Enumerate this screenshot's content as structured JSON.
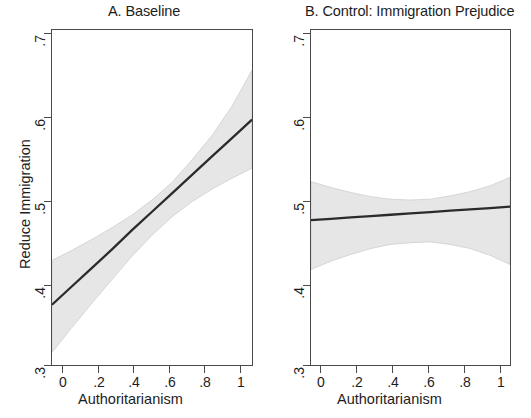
{
  "figure": {
    "background": "#ffffff",
    "line_color": "#2b2b2b",
    "band_color": "#e4e4e4",
    "axis_color": "#4a4a4a",
    "text_color": "#1d1d1d"
  },
  "panels": [
    {
      "id": "a",
      "title": "A. Baseline",
      "ylabel": "Reduce Immigration",
      "xlabel": "Authoritarianism",
      "ytick_labels": [
        ".7",
        ".6",
        ".5",
        ".4",
        ".3"
      ],
      "xtick_labels": [
        "0",
        ".2",
        ".4",
        ".6",
        ".8",
        "1"
      ]
    },
    {
      "id": "b",
      "title": "B. Control: Immigration Prejudice",
      "ylabel": "",
      "xlabel": "Authoritarianism",
      "ytick_labels": [
        ".7",
        ".6",
        ".5",
        ".4",
        ".3"
      ],
      "xtick_labels": [
        "0",
        ".2",
        ".4",
        ".6",
        ".8",
        "1"
      ]
    }
  ],
  "chart_data": [
    {
      "type": "line",
      "panel": "A. Baseline",
      "title": "A. Baseline",
      "xlabel": "Authoritarianism",
      "ylabel": "Reduce Immigration",
      "xlim": [
        0,
        1
      ],
      "ylim": [
        0.3,
        0.7
      ],
      "xticks": [
        0,
        0.2,
        0.4,
        0.6,
        0.8,
        1
      ],
      "yticks": [
        0.3,
        0.4,
        0.5,
        0.6,
        0.7
      ],
      "grid": false,
      "legend": "none",
      "x": [
        0,
        0.1,
        0.2,
        0.3,
        0.4,
        0.5,
        0.6,
        0.7,
        0.8,
        0.9,
        1
      ],
      "series": [
        {
          "name": "Predicted probability",
          "values": [
            0.372,
            0.394,
            0.416,
            0.438,
            0.461,
            0.483,
            0.505,
            0.527,
            0.549,
            0.571,
            0.593
          ]
        },
        {
          "name": "95% CI upper",
          "values": [
            0.425,
            0.437,
            0.45,
            0.464,
            0.479,
            0.497,
            0.518,
            0.545,
            0.574,
            0.609,
            0.652
          ]
        },
        {
          "name": "95% CI lower",
          "values": [
            0.315,
            0.345,
            0.374,
            0.402,
            0.43,
            0.455,
            0.477,
            0.495,
            0.51,
            0.523,
            0.535
          ]
        }
      ]
    },
    {
      "type": "line",
      "panel": "B. Control: Immigration Prejudice",
      "title": "B. Control: Immigration Prejudice",
      "xlabel": "Authoritarianism",
      "ylabel": "",
      "xlim": [
        0,
        1
      ],
      "ylim": [
        0.3,
        0.7
      ],
      "xticks": [
        0,
        0.2,
        0.4,
        0.6,
        0.8,
        1
      ],
      "yticks": [
        0.3,
        0.4,
        0.5,
        0.6,
        0.7
      ],
      "grid": false,
      "legend": "none",
      "x": [
        0,
        0.1,
        0.2,
        0.3,
        0.4,
        0.5,
        0.6,
        0.7,
        0.8,
        0.9,
        1
      ],
      "series": [
        {
          "name": "Predicted probability",
          "values": [
            0.473,
            0.4746,
            0.4762,
            0.4778,
            0.4794,
            0.481,
            0.4826,
            0.4842,
            0.4858,
            0.4874,
            0.489
          ]
        },
        {
          "name": "95% CI upper",
          "values": [
            0.519,
            0.512,
            0.506,
            0.501,
            0.498,
            0.497,
            0.498,
            0.502,
            0.507,
            0.514,
            0.524
          ]
        },
        {
          "name": "95% CI lower",
          "values": [
            0.414,
            0.424,
            0.432,
            0.439,
            0.444,
            0.446,
            0.447,
            0.444,
            0.439,
            0.431,
            0.42
          ]
        }
      ]
    }
  ]
}
